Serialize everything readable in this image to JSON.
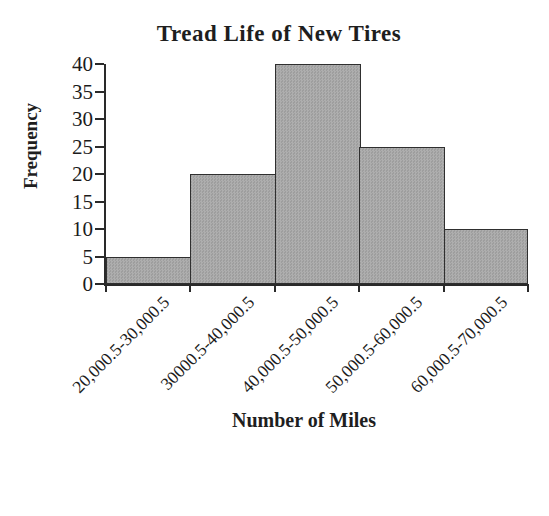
{
  "figure": {
    "background": "#ffffff",
    "axis_color": "#2a2a2a",
    "text_color": "#1b1b1b"
  },
  "chart_data": {
    "type": "bar",
    "subtype": "histogram",
    "title": "Tread Life of New Tires",
    "xlabel": "Number of Miles",
    "ylabel": "Frequency",
    "categories": [
      "20,000.5-30,000.5",
      "30000.5-40,000.5",
      "40,000.5-50,000.5",
      "50,000.5-60,000.5",
      "60,000.5-70,000.5"
    ],
    "values": [
      5,
      20,
      40,
      25,
      10
    ],
    "ylim": [
      0,
      40
    ],
    "yticks": [
      0,
      5,
      10,
      15,
      20,
      25,
      30,
      35,
      40
    ],
    "grid": false,
    "legend_position": "none",
    "bar_gap": 0,
    "bar_fill": "#a8a8a8",
    "bar_border": "#2f2f2f"
  }
}
